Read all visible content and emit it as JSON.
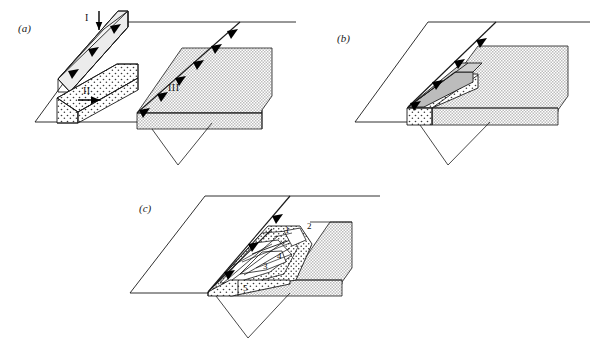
{
  "figure": {
    "type": "block-diagram-series",
    "background_color": "#ffffff",
    "line_color": "#1a1a1a",
    "stipple_fill_color": "#d8d8d8",
    "grey_fill_color": "#b8b8b8",
    "light_fill_color": "#e8e8e8",
    "tooth_color": "#000000"
  },
  "panels": [
    {
      "id": "a",
      "label": "(a)",
      "label_x": 18,
      "label_y": 29,
      "caption_units": [
        {
          "name": "I",
          "label": "I",
          "x": 88,
          "y": 17,
          "fill": "light",
          "arrow": "down"
        },
        {
          "name": "II",
          "label": "II",
          "x": 84,
          "y": 91,
          "fill": "stipple",
          "arrow": "right"
        },
        {
          "name": "III",
          "label": "III",
          "x": 170,
          "y": 88,
          "fill": "stipple",
          "arrow": "none"
        }
      ],
      "thrust_teeth_count": 6
    },
    {
      "id": "b",
      "label": "(b)",
      "label_x": 337,
      "label_y": 39,
      "caption_units": [],
      "thrust_teeth_count": 4
    },
    {
      "id": "c",
      "label": "(c)",
      "label_x": 139,
      "label_y": 209,
      "caption_units": [],
      "numbered_elements": [
        {
          "label": "1",
          "x": 287,
          "y": 231
        },
        {
          "label": "2",
          "x": 308,
          "y": 227
        },
        {
          "label": "3",
          "x": 265,
          "y": 267
        },
        {
          "label": "4",
          "x": 279,
          "y": 257
        },
        {
          "label": "5",
          "x": 245,
          "y": 289
        }
      ],
      "thrust_teeth_count": 3
    }
  ]
}
